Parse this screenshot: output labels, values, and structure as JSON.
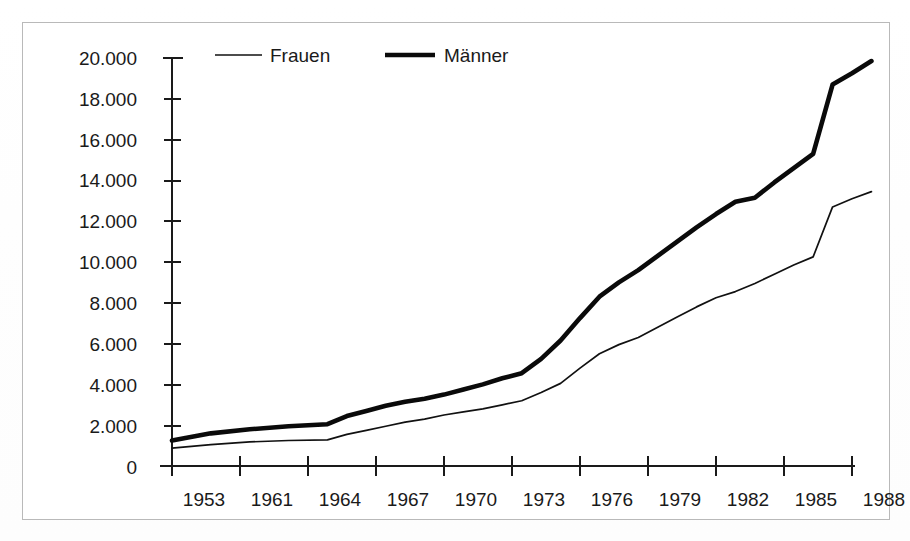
{
  "chart_data": {
    "type": "line",
    "title": "",
    "xlabel": "",
    "ylabel": "",
    "xlim": [
      1953,
      1989
    ],
    "ylim": [
      0,
      20000
    ],
    "grid": false,
    "legend_position": "top-inside",
    "y_ticks": [
      "0",
      "2.000",
      "4.000",
      "6.000",
      "8.000",
      "10.000",
      "12.000",
      "14.000",
      "16.000",
      "18.000",
      "20.000"
    ],
    "y_tick_values": [
      0,
      2000,
      4000,
      6000,
      8000,
      10000,
      12000,
      14000,
      16000,
      18000,
      20000
    ],
    "x_ticks": [
      "1953",
      "1961",
      "1964",
      "1967",
      "1970",
      "1973",
      "1976",
      "1979",
      "1982",
      "1985",
      "1988"
    ],
    "x_tick_values": [
      1953,
      1961,
      1964,
      1967,
      1970,
      1973,
      1976,
      1979,
      1982,
      1985,
      1988
    ],
    "x": [
      1953,
      1955,
      1957,
      1959,
      1961,
      1962,
      1963,
      1964,
      1965,
      1966,
      1967,
      1968,
      1969,
      1970,
      1971,
      1972,
      1973,
      1974,
      1975,
      1976,
      1977,
      1978,
      1979,
      1980,
      1981,
      1982,
      1983,
      1984,
      1985,
      1986,
      1987,
      1988,
      1989
    ],
    "series": [
      {
        "name": "Männer",
        "style": "thick",
        "color": "#0a0a0a",
        "values": [
          1250,
          1600,
          1800,
          1950,
          2050,
          2450,
          2700,
          2950,
          3150,
          3300,
          3500,
          3750,
          4000,
          4300,
          4550,
          5250,
          6150,
          7250,
          8300,
          9000,
          9600,
          10300,
          11000,
          11700,
          12350,
          12950,
          13150,
          13900,
          14600,
          15300,
          18700,
          19250,
          19850
        ]
      },
      {
        "name": "Frauen",
        "style": "thin",
        "color": "#111111",
        "values": [
          880,
          1050,
          1180,
          1250,
          1280,
          1550,
          1750,
          1950,
          2150,
          2300,
          2500,
          2650,
          2800,
          3000,
          3200,
          3600,
          4050,
          4800,
          5500,
          5950,
          6300,
          6800,
          7300,
          7800,
          8250,
          8550,
          8950,
          9400,
          9850,
          10250,
          12700,
          13100,
          13450
        ]
      }
    ],
    "legend": [
      {
        "label": "Frauen",
        "style": "thin"
      },
      {
        "label": "Männer",
        "style": "thick"
      }
    ]
  },
  "figure": {
    "frame_color": "#b9b9b9",
    "background": "#ffffff",
    "ink_color": "#1a1a1a"
  }
}
